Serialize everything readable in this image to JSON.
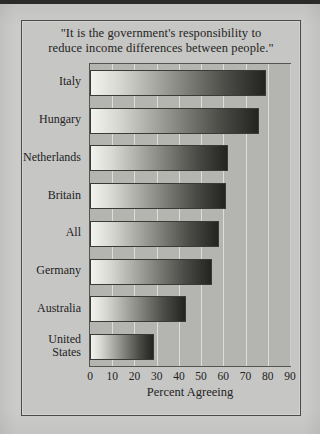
{
  "figure": {
    "title_lines": [
      "\"It is the government's responsibility to",
      "reduce income differences between people.\""
    ],
    "title_full": "\"It is the government's responsibility to reduce income differences between people.\""
  },
  "colors": {
    "page_background": "#cbcbc9",
    "frame_background": "#c6c6c4",
    "frame_border": "#4a4a48",
    "plot_background": "#b4b4b0",
    "gridline": "#e4e4e0",
    "bar_light_end": "#f2f2ee",
    "bar_dark_end": "#232321",
    "text": "#23231f"
  },
  "chart_data": {
    "type": "bar",
    "orientation": "horizontal",
    "title": "\"It is the government's responsibility to reduce income differences between people.\"",
    "xlabel": "Percent Agreeing",
    "ylabel": "",
    "categories": [
      "Italy",
      "Hungary",
      "Netherlands",
      "Britain",
      "All",
      "Germany",
      "Australia",
      "United States"
    ],
    "values": [
      79,
      76,
      62,
      61,
      58,
      55,
      43,
      29
    ],
    "xlim": [
      0,
      90
    ],
    "xticks": [
      0,
      10,
      20,
      30,
      40,
      50,
      60,
      70,
      80,
      90
    ],
    "xtick_labels": [
      "0",
      "10",
      "20",
      "30",
      "40",
      "50",
      "60",
      "70",
      "80",
      "90"
    ],
    "grid": true,
    "grid_axis": "x",
    "legend": false,
    "legend_position": "none",
    "bar_style": "horizontal-gradient light-to-dark"
  }
}
